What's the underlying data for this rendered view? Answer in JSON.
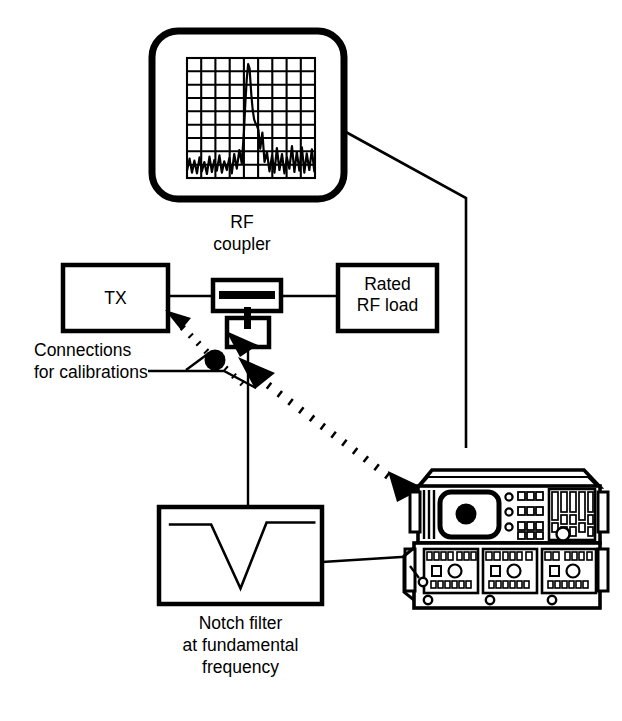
{
  "figure": {
    "kind": "block-diagram",
    "stroke_color": "#000000",
    "background_color": "#ffffff"
  },
  "blocks": {
    "tx": {
      "label": "TX"
    },
    "rf_coupler": {
      "label_line1": "RF",
      "label_line2": "coupler"
    },
    "rated_load": {
      "label_line1": "Rated",
      "label_line2": "RF load"
    },
    "notch_filter": {
      "label_line1": "Notch filter",
      "label_line2": "at fundamental",
      "label_line3": "frequency"
    },
    "connections_note": {
      "label_line1": "Connections",
      "label_line2": "for calibrations"
    }
  },
  "scope": {
    "name": "spectrum-display",
    "grid_cols": 9,
    "grid_rows": 9,
    "trace_description": "narrow fundamental carrier peak rising from a dense noise floor"
  },
  "chart_data": {
    "type": "line",
    "title": "",
    "xlabel": "",
    "ylabel": "",
    "grid": true,
    "legend": null,
    "xlim": [
      0,
      9
    ],
    "ylim": [
      0,
      9
    ],
    "series": [
      {
        "name": "spectrum-trace",
        "x": [
          0.0,
          0.18,
          0.35,
          0.52,
          0.7,
          0.88,
          1.05,
          1.22,
          1.4,
          1.58,
          1.75,
          1.92,
          2.1,
          2.28,
          2.45,
          2.62,
          2.8,
          2.98,
          3.15,
          3.32,
          3.5,
          3.68,
          3.85,
          4.0,
          4.1,
          4.2,
          4.3,
          4.4,
          4.52,
          4.62,
          4.72,
          4.82,
          4.92,
          5.02,
          5.15,
          5.3,
          5.45,
          5.62,
          5.8,
          5.98,
          6.15,
          6.32,
          6.5,
          6.68,
          6.85,
          7.02,
          7.2,
          7.38,
          7.55,
          7.72,
          7.9,
          8.08,
          8.25,
          8.42,
          8.6,
          8.78,
          8.95
        ],
        "y": [
          0.55,
          1.45,
          0.4,
          1.3,
          0.35,
          1.55,
          0.5,
          1.2,
          0.3,
          1.6,
          0.45,
          1.35,
          0.55,
          1.7,
          0.4,
          1.25,
          0.6,
          1.5,
          0.35,
          1.8,
          0.7,
          2.1,
          1.1,
          3.4,
          5.6,
          7.4,
          8.55,
          8.2,
          6.3,
          5.1,
          4.4,
          4.1,
          3.9,
          3.6,
          2.2,
          3.4,
          1.2,
          1.95,
          0.5,
          1.7,
          0.4,
          2.25,
          0.6,
          1.8,
          0.35,
          1.55,
          0.7,
          2.4,
          0.45,
          1.95,
          0.55,
          2.3,
          0.4,
          1.85,
          0.6,
          2.15,
          0.5
        ]
      }
    ]
  },
  "notch_response": {
    "type": "line",
    "description": "V-shaped notch rejection curve at fundamental frequency",
    "x": [
      0.06,
      0.32,
      0.5,
      0.66,
      0.8,
      0.96
    ],
    "y": [
      0.82,
      0.82,
      0.16,
      0.84,
      0.84,
      0.84
    ]
  },
  "instruments": {
    "analyzer": {
      "name": "spectrum-analyzer",
      "screen": "crt-screen",
      "marker_dot": true,
      "round_buttons": 3,
      "button_rows": 3,
      "keypad_columns": 5,
      "knob": true
    },
    "receiver": {
      "name": "measuring-receiver",
      "modules": 3,
      "knobs_per_module": 1,
      "feet": 3
    }
  },
  "links": [
    {
      "name": "tx-to-coupler",
      "style": "solid"
    },
    {
      "name": "coupler-to-load",
      "style": "solid"
    },
    {
      "name": "coupler-to-notch-filter",
      "style": "solid"
    },
    {
      "name": "notch-filter-to-receiver",
      "style": "solid"
    },
    {
      "name": "scope-to-analyzer",
      "style": "solid"
    },
    {
      "name": "calibration-cable-to-tx",
      "style": "dotted",
      "arrow": true
    },
    {
      "name": "calibration-cable-to-coupler-tap",
      "style": "dotted",
      "arrow": true
    },
    {
      "name": "calibration-cable-to-receiver",
      "style": "dotted",
      "arrow": true
    }
  ]
}
